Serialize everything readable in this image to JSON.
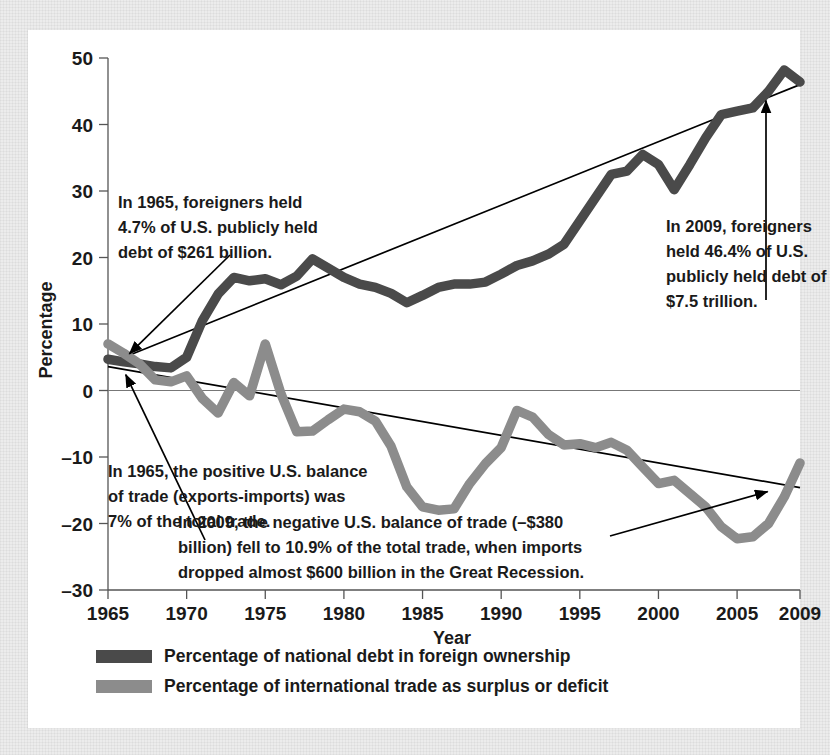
{
  "card": {
    "background": "#ffffff",
    "backdrop": "#ececec"
  },
  "chart_data": {
    "type": "line",
    "title": "",
    "xlabel": "Year",
    "ylabel": "Percentage",
    "xlim": [
      1965,
      2009
    ],
    "ylim": [
      -30,
      50
    ],
    "xticks": [
      "1965",
      "1970",
      "1975",
      "1980",
      "1985",
      "1990",
      "1995",
      "2000",
      "2005",
      "2009"
    ],
    "xtick_values": [
      1965,
      1970,
      1975,
      1980,
      1985,
      1990,
      1995,
      2000,
      2005,
      2009
    ],
    "yticks": [
      "50",
      "40",
      "30",
      "20",
      "10",
      "0",
      "-10",
      "-20",
      "-30"
    ],
    "ytick_values": [
      50,
      40,
      30,
      20,
      10,
      0,
      -10,
      -20,
      -30
    ],
    "grid": false,
    "legend_position": "below-axis",
    "x": [
      1965,
      1966,
      1967,
      1968,
      1969,
      1970,
      1971,
      1972,
      1973,
      1974,
      1975,
      1976,
      1977,
      1978,
      1979,
      1980,
      1981,
      1982,
      1983,
      1984,
      1985,
      1986,
      1987,
      1988,
      1989,
      1990,
      1991,
      1992,
      1993,
      1994,
      1995,
      1996,
      1997,
      1998,
      1999,
      2000,
      2001,
      2002,
      2003,
      2004,
      2005,
      2006,
      2007,
      2008,
      2009
    ],
    "series": [
      {
        "name": "Percentage of national debt in foreign ownership",
        "color": "#4a4a4a",
        "values": [
          4.7,
          4.3,
          4.0,
          3.6,
          3.4,
          5.0,
          10.5,
          14.5,
          17.0,
          16.5,
          16.8,
          15.9,
          17.2,
          19.8,
          18.4,
          17.0,
          16.0,
          15.5,
          14.6,
          13.2,
          14.3,
          15.5,
          16.0,
          16.0,
          16.3,
          17.5,
          18.8,
          19.5,
          20.5,
          22.0,
          25.5,
          29.0,
          32.5,
          33.0,
          35.5,
          34.0,
          30.2,
          34.0,
          38.0,
          41.5,
          42.0,
          42.5,
          45.0,
          48.2,
          46.4
        ]
      },
      {
        "name": "Percentage of international trade as surplus or deficit",
        "color": "#8c8c8c",
        "values": [
          7.0,
          5.6,
          4.0,
          1.6,
          1.3,
          2.2,
          -1.2,
          -3.4,
          1.2,
          -0.8,
          7.0,
          -0.5,
          -6.2,
          -6.1,
          -4.4,
          -2.8,
          -3.2,
          -4.6,
          -8.4,
          -14.5,
          -17.5,
          -18.0,
          -17.8,
          -14.0,
          -11.0,
          -8.6,
          -3.0,
          -4.0,
          -6.6,
          -8.2,
          -8.0,
          -8.6,
          -7.8,
          -9.0,
          -11.5,
          -14.0,
          -13.5,
          -15.5,
          -17.5,
          -20.5,
          -22.3,
          -22.0,
          -20.0,
          -16.0,
          -10.9
        ]
      }
    ],
    "trendlines": [
      {
        "name": "debt-trendline",
        "from": {
          "x": 1965.4,
          "y": 4.4
        },
        "to": {
          "x": 2009,
          "y": 46.0
        }
      },
      {
        "name": "trade-trendline",
        "from": {
          "x": 1965,
          "y": 3.6
        },
        "to": {
          "x": 2009,
          "y": -14.6
        }
      }
    ],
    "annotations": [
      {
        "id": "anno-1965-debt",
        "lines": [
          "In 1965, foreigners held",
          "4.7% of U.S. publicly held",
          "debt of $261 billion."
        ],
        "points_to": {
          "x": 1966.1,
          "y": 5.2
        }
      },
      {
        "id": "anno-2009-debt",
        "lines": [
          "In 2009, foreigners",
          "held 46.4% of U.S.",
          "publicly held debt of",
          "$7.5 trillion."
        ],
        "points_to": {
          "x": 2008.4,
          "y": 44.5
        }
      },
      {
        "id": "anno-1965-trade",
        "lines": [
          "In 1965, the positive U.S. balance",
          "of trade (exports-imports) was",
          "7% of the total trade."
        ],
        "points_to": {
          "x": 1966.0,
          "y": 3.0
        }
      },
      {
        "id": "anno-2009-trade",
        "lines": [
          "In 2009, the negative U.S. balance of trade (–$380",
          "billion) fell to 10.9% of the total trade, when imports",
          "dropped almost $600 billion in the Great Recession."
        ],
        "points_to": {
          "x": 2007.2,
          "y": -15.5
        }
      }
    ],
    "legend": [
      {
        "label": "Percentage of national debt in foreign ownership",
        "color": "#4a4a4a"
      },
      {
        "label": "Percentage of international trade as surplus or deficit",
        "color": "#8c8c8c"
      }
    ]
  }
}
